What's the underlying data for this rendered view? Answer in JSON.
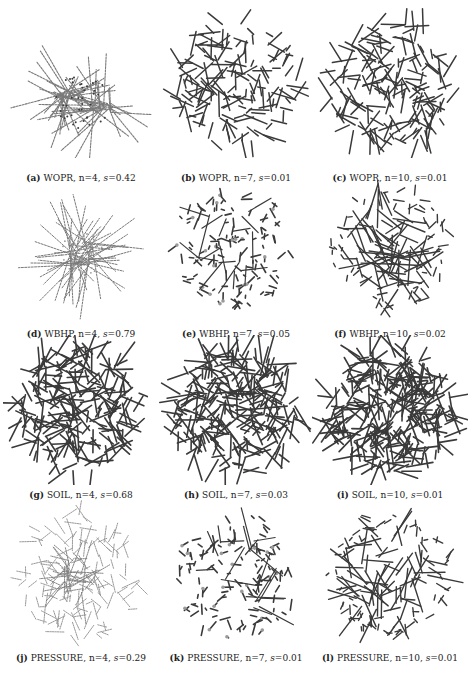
{
  "figure": {
    "panels": [
      {
        "label": "(a)",
        "metric": "WOPR",
        "n": "n=4",
        "s_symbol": "s",
        "s_value": "=0.42",
        "style": "bipolar",
        "density": 70,
        "seed": 11
      },
      {
        "label": "(b)",
        "metric": "WOPR",
        "n": "n=7",
        "s_symbol": "s",
        "s_value": "=0.01",
        "style": "tangle",
        "density": 150,
        "seed": 23
      },
      {
        "label": "(c)",
        "metric": "WOPR",
        "n": "n=10",
        "s_symbol": "s",
        "s_value": "=0.01",
        "style": "tangle",
        "density": 170,
        "seed": 37
      },
      {
        "label": "(d)",
        "metric": "WBHP",
        "n": "n=4",
        "s_symbol": "s",
        "s_value": "=0.79",
        "style": "star",
        "density": 60,
        "seed": 41
      },
      {
        "label": "(e)",
        "metric": "WBHP",
        "n": "n=7",
        "s_symbol": "s",
        "s_value": "=0.05",
        "style": "scatter",
        "density": 120,
        "seed": 53
      },
      {
        "label": "(f)",
        "metric": "WBHP",
        "n": "n=10",
        "s_symbol": "s",
        "s_value": "=0.02",
        "style": "mixed",
        "density": 140,
        "seed": 67
      },
      {
        "label": "(g)",
        "metric": "SOIL",
        "n": "n=4",
        "s_symbol": "s",
        "s_value": "=0.68",
        "style": "dense",
        "density": 230,
        "seed": 71
      },
      {
        "label": "(h)",
        "metric": "SOIL",
        "n": "n=7",
        "s_symbol": "s",
        "s_value": "=0.03",
        "style": "dense",
        "density": 260,
        "seed": 83
      },
      {
        "label": "(i)",
        "metric": "SOIL",
        "n": "n=10",
        "s_symbol": "s",
        "s_value": "=0.01",
        "style": "dense",
        "density": 300,
        "seed": 97
      },
      {
        "label": "(j)",
        "metric": "PRESSURE",
        "n": "n=4",
        "s_symbol": "s",
        "s_value": "=0.29",
        "style": "globe",
        "density": 130,
        "seed": 101
      },
      {
        "label": "(k)",
        "metric": "PRESSURE",
        "n": "n=7",
        "s_symbol": "s",
        "s_value": "=0.01",
        "style": "scatter",
        "density": 120,
        "seed": 113
      },
      {
        "label": "(l)",
        "metric": "PRESSURE",
        "n": "n=10",
        "s_symbol": "s",
        "s_value": "=0.01",
        "style": "mixed",
        "density": 150,
        "seed": 127
      }
    ],
    "colors": {
      "ink": "#3a3a3a",
      "ink_light": "#7a7a7a",
      "node": "#9a9a9a",
      "background": "#ffffff"
    }
  }
}
